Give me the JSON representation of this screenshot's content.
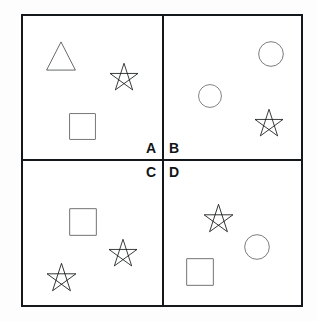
{
  "figure": {
    "background_color": "#fdfdfd",
    "panel_color": "#ffffff",
    "ink_color": "#121416",
    "border_color": "#15181a"
  },
  "quadrants": [
    {
      "id": "a",
      "label": "A",
      "label_position": "bottom-right",
      "shapes": [
        {
          "type": "triangle",
          "name": "triangle-shape",
          "x": 22,
          "y": 24,
          "size": 32
        },
        {
          "type": "star",
          "name": "star-shape",
          "x": 85,
          "y": 46,
          "size": 32
        },
        {
          "type": "square",
          "name": "square-shape",
          "x": 45,
          "y": 96,
          "size": 29
        }
      ]
    },
    {
      "id": "b",
      "label": "B",
      "label_position": "bottom-left",
      "shapes": [
        {
          "type": "circle",
          "name": "circle-shape",
          "x": 93,
          "y": 24,
          "size": 28
        },
        {
          "type": "circle",
          "name": "circle-shape",
          "x": 33,
          "y": 67,
          "size": 26
        },
        {
          "type": "star",
          "name": "star-shape",
          "x": 89,
          "y": 92,
          "size": 32
        }
      ]
    },
    {
      "id": "c",
      "label": "C",
      "label_position": "top-right",
      "shapes": [
        {
          "type": "square",
          "name": "square-shape",
          "x": 45,
          "y": 46,
          "size": 30
        },
        {
          "type": "star",
          "name": "star-shape",
          "x": 84,
          "y": 77,
          "size": 32
        },
        {
          "type": "star",
          "name": "star-shape",
          "x": 22,
          "y": 101,
          "size": 33
        }
      ]
    },
    {
      "id": "d",
      "label": "D",
      "label_position": "top-left",
      "shapes": [
        {
          "type": "star",
          "name": "star-shape",
          "x": 38,
          "y": 42,
          "size": 33
        },
        {
          "type": "circle",
          "name": "circle-shape",
          "x": 79,
          "y": 72,
          "size": 28
        },
        {
          "type": "square",
          "name": "square-shape",
          "x": 21,
          "y": 96,
          "size": 30
        }
      ]
    }
  ]
}
